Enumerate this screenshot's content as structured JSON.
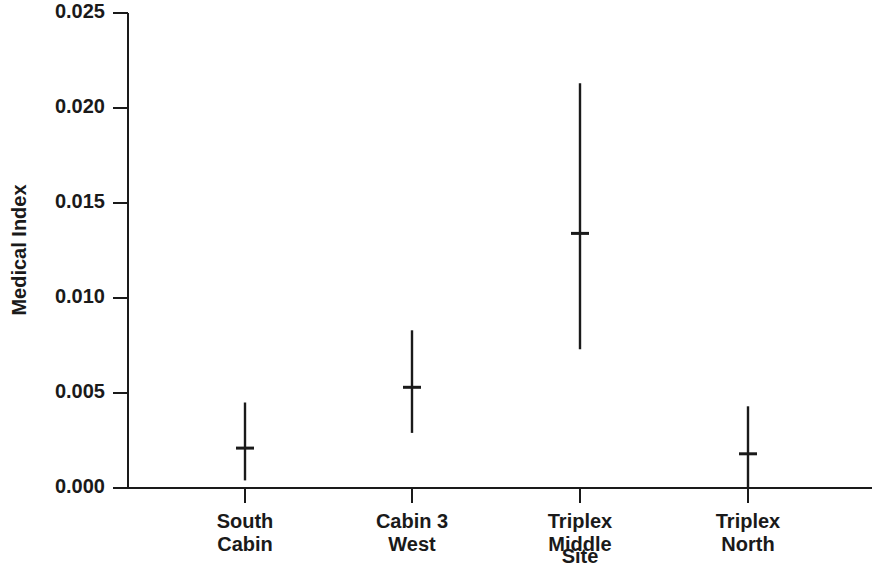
{
  "chart_data": {
    "type": "scatter",
    "title": "",
    "xlabel": "Site",
    "ylabel": "Medical Index",
    "categories": [
      "South Cabin",
      "Cabin 3 West",
      "Triplex Middle",
      "Triplex North"
    ],
    "category_lines": [
      [
        "South",
        "Cabin"
      ],
      [
        "Cabin 3",
        "West"
      ],
      [
        "Triplex",
        "Middle"
      ],
      [
        "Triplex",
        "North"
      ]
    ],
    "values": [
      0.0021,
      0.0053,
      0.0134,
      0.0018
    ],
    "lower": [
      0.0004,
      0.0029,
      0.0073,
      0.0
    ],
    "upper": [
      0.0045,
      0.0083,
      0.0213,
      0.0043
    ],
    "series": [
      {
        "name": "Medical Index",
        "points": [
          {
            "category": "South Cabin",
            "value": 0.0021,
            "lower": 0.0004,
            "upper": 0.0045
          },
          {
            "category": "Cabin 3 West",
            "value": 0.0053,
            "lower": 0.0029,
            "upper": 0.0083
          },
          {
            "category": "Triplex Middle",
            "value": 0.0134,
            "lower": 0.0073,
            "upper": 0.0213
          },
          {
            "category": "Triplex North",
            "value": 0.0018,
            "lower": 0.0,
            "upper": 0.0043
          }
        ]
      }
    ],
    "ylim": [
      0.0,
      0.025
    ],
    "yticks": [
      0.0,
      0.005,
      0.01,
      0.015,
      0.02,
      0.025
    ],
    "ytick_labels": [
      "0.000",
      "0.005",
      "0.010",
      "0.015",
      "0.020",
      "0.025"
    ],
    "grid": false,
    "legend": null,
    "marker": "error-bar-with-mean-tick",
    "colors": {
      "ink": "#1a1a1a",
      "background": "#ffffff"
    }
  },
  "axes": {
    "y_title": "Medical Index",
    "x_title": "Site"
  }
}
